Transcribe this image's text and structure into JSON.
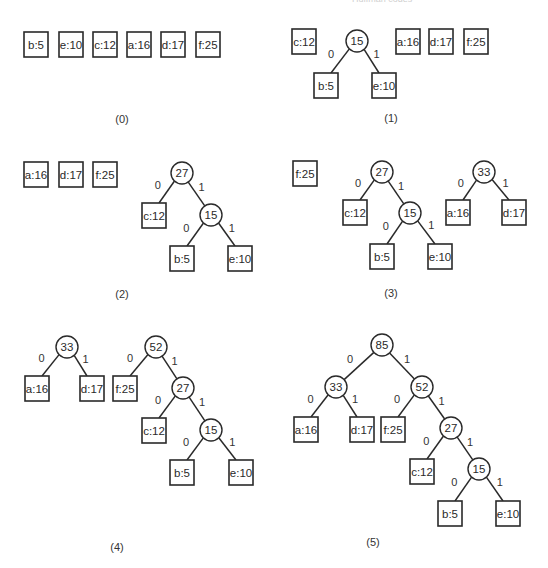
{
  "header": {
    "running_title": "Huffman codes",
    "page_number": ""
  },
  "figure": {
    "panels": [
      {
        "id": "0",
        "caption": "(0)",
        "caption_pos": [
          122,
          119
        ],
        "leaves": [
          {
            "label": "b:5",
            "x": 24,
            "y": 32
          },
          {
            "label": "e:10",
            "x": 59,
            "y": 32
          },
          {
            "label": "c:12",
            "x": 93,
            "y": 32
          },
          {
            "label": "a:16",
            "x": 127,
            "y": 32
          },
          {
            "label": "d:17",
            "x": 161,
            "y": 32
          },
          {
            "label": "f:25",
            "x": 196,
            "y": 32
          }
        ],
        "internals": [],
        "edges": []
      },
      {
        "id": "1",
        "caption": "(1)",
        "caption_pos": [
          391,
          118
        ],
        "leaves": [
          {
            "key": "c",
            "label": "c:12",
            "x": 292,
            "y": 29
          },
          {
            "key": "b",
            "label": "b:5",
            "x": 314,
            "y": 73
          },
          {
            "key": "e",
            "label": "e:10",
            "x": 372,
            "y": 73
          },
          {
            "key": "a",
            "label": "a:16",
            "x": 396,
            "y": 29
          },
          {
            "key": "d",
            "label": "d:17",
            "x": 429,
            "y": 29
          },
          {
            "key": "f",
            "label": "f:25",
            "x": 464,
            "y": 29
          }
        ],
        "internals": [
          {
            "key": "n15",
            "label": "15",
            "cx": 357,
            "cy": 41
          }
        ],
        "edges": [
          {
            "from": "n15",
            "to": "b",
            "bit": "0"
          },
          {
            "from": "n15",
            "to": "e",
            "bit": "1"
          }
        ]
      },
      {
        "id": "2",
        "caption": "(2)",
        "caption_pos": [
          122,
          294
        ],
        "leaves": [
          {
            "key": "a",
            "label": "a:16",
            "x": 24,
            "y": 162
          },
          {
            "key": "d",
            "label": "d:17",
            "x": 59,
            "y": 162
          },
          {
            "key": "f",
            "label": "f:25",
            "x": 93,
            "y": 162
          },
          {
            "key": "c",
            "label": "c:12",
            "x": 142,
            "y": 203
          },
          {
            "key": "b",
            "label": "b:5",
            "x": 170,
            "y": 246
          },
          {
            "key": "e",
            "label": "e:10",
            "x": 228,
            "y": 246
          }
        ],
        "internals": [
          {
            "key": "n27",
            "label": "27",
            "cx": 182,
            "cy": 173
          },
          {
            "key": "n15",
            "label": "15",
            "cx": 211,
            "cy": 215
          }
        ],
        "edges": [
          {
            "from": "n27",
            "to": "c",
            "bit": "0"
          },
          {
            "from": "n27",
            "to": "n15",
            "bit": "1"
          },
          {
            "from": "n15",
            "to": "b",
            "bit": "0"
          },
          {
            "from": "n15",
            "to": "e",
            "bit": "1"
          }
        ]
      },
      {
        "id": "3",
        "caption": "(3)",
        "caption_pos": [
          391,
          293
        ],
        "leaves": [
          {
            "key": "f",
            "label": "f:25",
            "x": 293,
            "y": 161
          },
          {
            "key": "c",
            "label": "c:12",
            "x": 343,
            "y": 200
          },
          {
            "key": "b",
            "label": "b:5",
            "x": 370,
            "y": 244
          },
          {
            "key": "e",
            "label": "e:10",
            "x": 428,
            "y": 244
          },
          {
            "key": "a",
            "label": "a:16",
            "x": 446,
            "y": 200
          },
          {
            "key": "d",
            "label": "d:17",
            "x": 502,
            "y": 200
          }
        ],
        "internals": [
          {
            "key": "n27",
            "label": "27",
            "cx": 382,
            "cy": 172
          },
          {
            "key": "n15",
            "label": "15",
            "cx": 410,
            "cy": 213
          },
          {
            "key": "n33",
            "label": "33",
            "cx": 484,
            "cy": 172
          }
        ],
        "edges": [
          {
            "from": "n27",
            "to": "c",
            "bit": "0"
          },
          {
            "from": "n27",
            "to": "n15",
            "bit": "1"
          },
          {
            "from": "n15",
            "to": "b",
            "bit": "0"
          },
          {
            "from": "n15",
            "to": "e",
            "bit": "1"
          },
          {
            "from": "n33",
            "to": "a",
            "bit": "0"
          },
          {
            "from": "n33",
            "to": "d",
            "bit": "1"
          }
        ]
      },
      {
        "id": "4",
        "caption": "(4)",
        "caption_pos": [
          117,
          547
        ],
        "leaves": [
          {
            "key": "a",
            "label": "a:16",
            "x": 25,
            "y": 376
          },
          {
            "key": "d",
            "label": "d:17",
            "x": 80,
            "y": 376
          },
          {
            "key": "f",
            "label": "f:25",
            "x": 113,
            "y": 376
          },
          {
            "key": "c",
            "label": "c:12",
            "x": 142,
            "y": 418
          },
          {
            "key": "b",
            "label": "b:5",
            "x": 170,
            "y": 460
          },
          {
            "key": "e",
            "label": "e:10",
            "x": 229,
            "y": 460
          }
        ],
        "internals": [
          {
            "key": "n33",
            "label": "33",
            "cx": 67,
            "cy": 347
          },
          {
            "key": "n52",
            "label": "52",
            "cx": 156,
            "cy": 347
          },
          {
            "key": "n27",
            "label": "27",
            "cx": 183,
            "cy": 388
          },
          {
            "key": "n15",
            "label": "15",
            "cx": 211,
            "cy": 430
          }
        ],
        "edges": [
          {
            "from": "n33",
            "to": "a",
            "bit": "0"
          },
          {
            "from": "n33",
            "to": "d",
            "bit": "1"
          },
          {
            "from": "n52",
            "to": "f",
            "bit": "0"
          },
          {
            "from": "n52",
            "to": "n27",
            "bit": "1"
          },
          {
            "from": "n27",
            "to": "c",
            "bit": "0"
          },
          {
            "from": "n27",
            "to": "n15",
            "bit": "1"
          },
          {
            "from": "n15",
            "to": "b",
            "bit": "0"
          },
          {
            "from": "n15",
            "to": "e",
            "bit": "1"
          }
        ]
      },
      {
        "id": "5",
        "caption": "(5)",
        "caption_pos": [
          373,
          542
        ],
        "leaves": [
          {
            "key": "a",
            "label": "a:16",
            "x": 294,
            "y": 417
          },
          {
            "key": "d",
            "label": "d:17",
            "x": 350,
            "y": 417
          },
          {
            "key": "f",
            "label": "f:25",
            "x": 381,
            "y": 417
          },
          {
            "key": "c",
            "label": "c:12",
            "x": 410,
            "y": 459
          },
          {
            "key": "b",
            "label": "b:5",
            "x": 438,
            "y": 501
          },
          {
            "key": "e",
            "label": "e:10",
            "x": 496,
            "y": 501
          }
        ],
        "internals": [
          {
            "key": "n85",
            "label": "85",
            "cx": 382,
            "cy": 345
          },
          {
            "key": "n33",
            "label": "33",
            "cx": 336,
            "cy": 387
          },
          {
            "key": "n52",
            "label": "52",
            "cx": 422,
            "cy": 387
          },
          {
            "key": "n27",
            "label": "27",
            "cx": 451,
            "cy": 428
          },
          {
            "key": "n15",
            "label": "15",
            "cx": 479,
            "cy": 469
          }
        ],
        "edges": [
          {
            "from": "n85",
            "to": "n33",
            "bit": "0"
          },
          {
            "from": "n85",
            "to": "n52",
            "bit": "1"
          },
          {
            "from": "n33",
            "to": "a",
            "bit": "0"
          },
          {
            "from": "n33",
            "to": "d",
            "bit": "1"
          },
          {
            "from": "n52",
            "to": "f",
            "bit": "0"
          },
          {
            "from": "n52",
            "to": "n27",
            "bit": "1"
          },
          {
            "from": "n27",
            "to": "c",
            "bit": "0"
          },
          {
            "from": "n27",
            "to": "n15",
            "bit": "1"
          },
          {
            "from": "n15",
            "to": "b",
            "bit": "0"
          },
          {
            "from": "n15",
            "to": "e",
            "bit": "1"
          }
        ]
      }
    ],
    "geometry": {
      "box_w": 24,
      "box_h": 25,
      "circle_r": 11
    }
  }
}
